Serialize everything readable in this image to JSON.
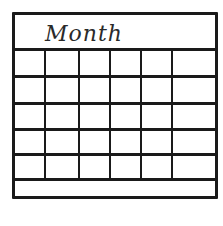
{
  "calendar": {
    "title": "Month",
    "columns": 6,
    "rows": 5,
    "line_color": "#1a1a1a",
    "cells": [
      [
        "",
        "",
        "",
        "",
        "",
        ""
      ],
      [
        "",
        "",
        "",
        "",
        "",
        ""
      ],
      [
        "",
        "",
        "",
        "",
        "",
        ""
      ],
      [
        "",
        "",
        "",
        "",
        "",
        ""
      ],
      [
        "",
        "",
        "",
        "",
        "",
        ""
      ]
    ]
  }
}
